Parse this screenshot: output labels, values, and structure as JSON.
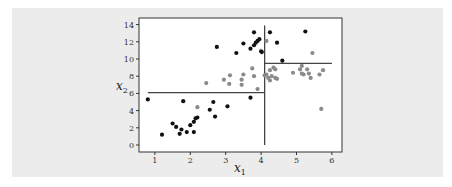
{
  "chart_data": {
    "type": "scatter",
    "title": "",
    "xlabel": "x_1",
    "ylabel": "x_2",
    "xlim": [
      0.6,
      6.3
    ],
    "ylim": [
      -0.6,
      14.6
    ],
    "xticks": [
      1,
      2,
      3,
      4,
      5,
      6
    ],
    "yticks": [
      0,
      2,
      4,
      6,
      8,
      10,
      12,
      14
    ],
    "grid": false,
    "legend": null,
    "series": [
      {
        "name": "class_black",
        "color": "#111111",
        "points": [
          [
            0.8,
            5.3
          ],
          [
            1.2,
            1.2
          ],
          [
            1.5,
            2.5
          ],
          [
            1.6,
            2.1
          ],
          [
            1.7,
            1.3
          ],
          [
            1.75,
            1.8
          ],
          [
            1.8,
            5.1
          ],
          [
            1.9,
            1.5
          ],
          [
            2.0,
            2.3
          ],
          [
            2.1,
            1.5
          ],
          [
            2.1,
            2.7
          ],
          [
            2.15,
            3.1
          ],
          [
            2.2,
            3.2
          ],
          [
            2.55,
            4.1
          ],
          [
            2.65,
            5.0
          ],
          [
            2.7,
            3.3
          ],
          [
            2.75,
            11.4
          ],
          [
            3.05,
            4.5
          ],
          [
            3.3,
            10.7
          ],
          [
            3.5,
            11.8
          ],
          [
            3.7,
            11.2
          ],
          [
            3.7,
            5.5
          ],
          [
            3.8,
            11.6
          ],
          [
            3.8,
            13.1
          ],
          [
            3.85,
            11.9
          ],
          [
            3.9,
            12.1
          ],
          [
            3.95,
            12.3
          ],
          [
            4.0,
            10.9
          ],
          [
            4.02,
            10.8
          ],
          [
            4.25,
            13.1
          ],
          [
            4.45,
            11.9
          ],
          [
            4.6,
            9.8
          ],
          [
            5.25,
            13.2
          ]
        ]
      },
      {
        "name": "class_gray",
        "color": "#8a8a8a",
        "points": [
          [
            2.2,
            4.4
          ],
          [
            2.45,
            7.2
          ],
          [
            2.95,
            7.6
          ],
          [
            3.1,
            7.1
          ],
          [
            3.12,
            8.1
          ],
          [
            3.45,
            7.0
          ],
          [
            3.45,
            7.6
          ],
          [
            3.5,
            8.2
          ],
          [
            3.75,
            8.9
          ],
          [
            3.8,
            8.0
          ],
          [
            3.9,
            6.5
          ],
          [
            4.1,
            8.1
          ],
          [
            4.15,
            8.2
          ],
          [
            4.15,
            12.1
          ],
          [
            4.2,
            7.8
          ],
          [
            4.25,
            7.5
          ],
          [
            4.25,
            8.7
          ],
          [
            4.3,
            8.0
          ],
          [
            4.35,
            9.0
          ],
          [
            4.4,
            8.8
          ],
          [
            4.4,
            7.8
          ],
          [
            4.45,
            7.7
          ],
          [
            4.9,
            8.4
          ],
          [
            5.1,
            8.8
          ],
          [
            5.15,
            9.2
          ],
          [
            5.15,
            8.3
          ],
          [
            5.2,
            8.2
          ],
          [
            5.3,
            8.8
          ],
          [
            5.35,
            8.3
          ],
          [
            5.4,
            7.8
          ],
          [
            5.45,
            10.7
          ],
          [
            5.65,
            8.2
          ],
          [
            5.7,
            4.2
          ],
          [
            5.75,
            8.7
          ]
        ]
      }
    ],
    "split_lines": [
      {
        "orientation": "vertical",
        "x": 4.1,
        "y_from": 0,
        "y_to": 13.9
      },
      {
        "orientation": "horizontal",
        "y": 6.1,
        "x_from": 0.8,
        "x_to": 4.1
      },
      {
        "orientation": "horizontal",
        "y": 9.5,
        "x_from": 4.1,
        "x_to": 6.0
      }
    ]
  },
  "labels": {
    "x_main": "x",
    "x_sub": "1",
    "y_main": "x",
    "y_sub": "2"
  }
}
